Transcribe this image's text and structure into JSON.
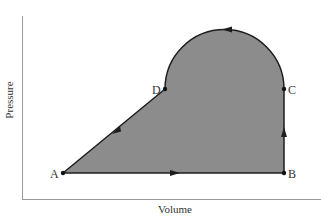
{
  "diagram": {
    "type": "pv-cycle",
    "axes": {
      "xlabel": "Volume",
      "ylabel": "Pressure"
    },
    "points": [
      {
        "id": "A",
        "label": "A",
        "x": 63,
        "y": 173
      },
      {
        "id": "B",
        "label": "B",
        "x": 284,
        "y": 173
      },
      {
        "id": "C",
        "label": "C",
        "x": 284,
        "y": 89
      },
      {
        "id": "D",
        "label": "D",
        "x": 165,
        "y": 89
      }
    ],
    "paths": [
      {
        "from": "A",
        "to": "B",
        "shape": "line",
        "arrow": "right"
      },
      {
        "from": "B",
        "to": "C",
        "shape": "line",
        "arrow": "up"
      },
      {
        "from": "C",
        "to": "D",
        "shape": "semicircle-arc",
        "arrow": "left"
      },
      {
        "from": "D",
        "to": "A",
        "shape": "line",
        "arrow": "down-left"
      }
    ],
    "colors": {
      "fill": "#8c8c8c",
      "stroke": "#1e1e1e",
      "axis": "#9a9a9a",
      "text": "#333333"
    }
  }
}
